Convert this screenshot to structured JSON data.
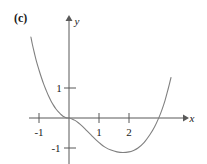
{
  "figure": {
    "part_label": "(c)",
    "background_color": "#ffffff",
    "curve_color": "#808080",
    "axis_color": "#595959",
    "text_color": "#1a1a1a"
  },
  "chart_data": {
    "type": "line",
    "title": "",
    "subtitle": "",
    "xlabel": "x",
    "ylabel": "y",
    "xlim": [
      -1.35,
      3.85
    ],
    "ylim": [
      -1.55,
      3.45
    ],
    "grid": false,
    "legend": null,
    "annotations": [],
    "xticks": [
      -1,
      1,
      2
    ],
    "xtick_labels": [
      "-1",
      "1",
      "2"
    ],
    "yticks": [
      1,
      -1
    ],
    "ytick_labels": [
      "1",
      "-1"
    ],
    "series": [
      {
        "name": "curve",
        "x": [
          -1.27,
          -1.22,
          -1.15,
          -1.08,
          -1.0,
          -0.92,
          -0.84,
          -0.76,
          -0.68,
          -0.6,
          -0.52,
          -0.44,
          -0.36,
          -0.28,
          -0.2,
          -0.12,
          -0.05,
          0.0,
          0.1,
          0.2,
          0.3,
          0.45,
          0.6,
          0.75,
          0.9,
          1.05,
          1.2,
          1.4,
          1.6,
          1.8,
          2.0,
          2.15,
          2.3,
          2.5,
          2.7,
          2.85,
          3.0,
          3.1,
          3.2,
          3.3,
          3.4
        ],
        "y": [
          2.7,
          2.45,
          2.15,
          1.87,
          1.6,
          1.35,
          1.12,
          0.92,
          0.73,
          0.57,
          0.43,
          0.31,
          0.21,
          0.13,
          0.06,
          0.02,
          0.0,
          0.0,
          -0.03,
          -0.08,
          -0.15,
          -0.28,
          -0.43,
          -0.58,
          -0.73,
          -0.86,
          -0.97,
          -1.07,
          -1.13,
          -1.15,
          -1.13,
          -1.08,
          -1.0,
          -0.82,
          -0.55,
          -0.3,
          0.02,
          0.28,
          0.58,
          0.95,
          1.35
        ]
      }
    ]
  },
  "axes": {
    "x_axis_name": "x-axis",
    "y_axis_name": "y-axis",
    "x_arrow": "arrow-right",
    "y_arrow": "arrow-up"
  }
}
